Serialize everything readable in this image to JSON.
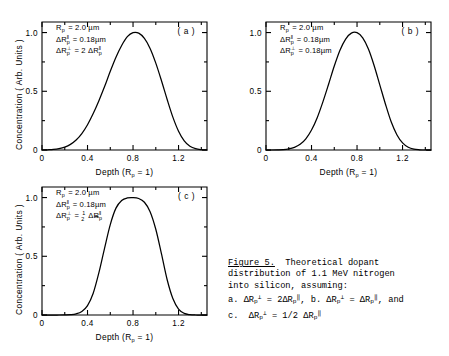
{
  "figure": {
    "axes": {
      "xlabel": "Depth (R",
      "xlabel_sub": "p",
      "xlabel_tail": " = 1)",
      "ylabel": "Concentration ( Arb. Units )",
      "xticks": [
        "0",
        "0.4",
        "0.8",
        "1.2"
      ],
      "xtickvals": [
        0,
        0.4,
        0.8,
        1.2
      ],
      "yticks": [
        "0",
        "0.5",
        "1.0"
      ],
      "ytickvals": [
        0,
        0.5,
        1.0
      ],
      "xlim": [
        0,
        1.45
      ],
      "ylim": [
        0,
        1.09
      ]
    },
    "panels": [
      {
        "tag": "( a )",
        "annotations": [
          {
            "lead": "R",
            "sub": "p",
            "sup": "",
            "rest": "= 2.0 µm"
          },
          {
            "lead": "ΔR",
            "sub": "p",
            "sup": "‖",
            "rest": "= 0.18µm"
          },
          {
            "lead": "ΔR",
            "sub": "p",
            "sup": "⊥",
            "rest": "= 2 ΔR",
            "rest_sub": "p",
            "rest_sup": "‖"
          }
        ]
      },
      {
        "tag": "( b )",
        "annotations": [
          {
            "lead": "R",
            "sub": "p",
            "sup": "",
            "rest": "= 2.0 µm"
          },
          {
            "lead": "ΔR",
            "sub": "p",
            "sup": "‖",
            "rest": "= 0.18µm"
          },
          {
            "lead": "ΔR",
            "sub": "p",
            "sup": "⊥",
            "rest": "= 0.18µm"
          }
        ]
      },
      {
        "tag": "( c )",
        "annotations": [
          {
            "lead": "R",
            "sub": "p",
            "sup": "",
            "rest": "= 2.0 µm"
          },
          {
            "lead": "ΔR",
            "sub": "p",
            "sup": "‖",
            "rest": "= 0.18µm"
          },
          {
            "lead": "ΔR",
            "sub": "p",
            "sup": "⊥",
            "rest": "= ½ ΔR",
            "rest_sub": "p",
            "rest_sup": "‖",
            "fraction": true
          }
        ]
      }
    ]
  },
  "chart_data": {
    "type": "line",
    "xlabel": "Depth (Rp = 1)",
    "ylabel": "Concentration (Arb. Units)",
    "xlim": [
      0,
      1.45
    ],
    "ylim": [
      0,
      1.09
    ],
    "xticks": [
      0,
      0.4,
      0.8,
      1.2
    ],
    "yticks": [
      0,
      0.5,
      1.0
    ],
    "grid": false,
    "legend": "none",
    "panels": [
      {
        "name": "(a)",
        "peak_x": 0.81,
        "peak_y": 1.0,
        "description": "broad asymmetric peak, widest of the three",
        "x": [
          0.0,
          0.05,
          0.1,
          0.15,
          0.2,
          0.25,
          0.3,
          0.35,
          0.4,
          0.45,
          0.5,
          0.55,
          0.6,
          0.65,
          0.7,
          0.75,
          0.8,
          0.85,
          0.9,
          0.95,
          1.0,
          1.05,
          1.1,
          1.15,
          1.2,
          1.25,
          1.3,
          1.35,
          1.4,
          1.45
        ],
        "y": [
          0.0,
          0.002,
          0.005,
          0.012,
          0.025,
          0.048,
          0.085,
          0.14,
          0.215,
          0.31,
          0.42,
          0.54,
          0.67,
          0.79,
          0.89,
          0.965,
          0.999,
          0.995,
          0.95,
          0.865,
          0.74,
          0.59,
          0.43,
          0.28,
          0.16,
          0.078,
          0.032,
          0.011,
          0.003,
          0.0
        ]
      },
      {
        "name": "(b)",
        "peak_x": 0.77,
        "peak_y": 1.0,
        "description": "intermediate width symmetric peak with rounded top",
        "x": [
          0.0,
          0.05,
          0.1,
          0.15,
          0.2,
          0.25,
          0.3,
          0.35,
          0.4,
          0.45,
          0.5,
          0.55,
          0.6,
          0.65,
          0.7,
          0.75,
          0.8,
          0.85,
          0.9,
          0.95,
          1.0,
          1.05,
          1.1,
          1.15,
          1.2,
          1.25,
          1.3,
          1.35,
          1.4,
          1.45
        ],
        "y": [
          0.0,
          0.0,
          0.001,
          0.003,
          0.009,
          0.022,
          0.048,
          0.095,
          0.17,
          0.275,
          0.41,
          0.56,
          0.715,
          0.85,
          0.945,
          0.995,
          0.999,
          0.955,
          0.86,
          0.72,
          0.555,
          0.39,
          0.24,
          0.13,
          0.06,
          0.023,
          0.007,
          0.002,
          0.0,
          0.0
        ]
      },
      {
        "name": "(c)",
        "peak_x": 0.78,
        "peak_y": 1.0,
        "description": "narrow flat-topped peak, steepest sides",
        "x": [
          0.0,
          0.05,
          0.1,
          0.15,
          0.2,
          0.25,
          0.3,
          0.35,
          0.4,
          0.45,
          0.5,
          0.55,
          0.6,
          0.65,
          0.7,
          0.75,
          0.8,
          0.85,
          0.9,
          0.95,
          1.0,
          1.05,
          1.1,
          1.15,
          1.2,
          1.25,
          1.3,
          1.35,
          1.4,
          1.45
        ],
        "y": [
          0.0,
          0.0,
          0.0,
          0.0,
          0.001,
          0.003,
          0.01,
          0.03,
          0.08,
          0.185,
          0.36,
          0.57,
          0.77,
          0.91,
          0.975,
          0.997,
          1.0,
          0.992,
          0.96,
          0.88,
          0.73,
          0.52,
          0.3,
          0.14,
          0.05,
          0.014,
          0.003,
          0.0,
          0.0,
          0.0
        ]
      }
    ]
  },
  "caption": {
    "label": "Figure 5.",
    "line1": "  Theoretical dopant",
    "line2": "distribution of 1.1 MeV nitrogen",
    "line3": "into silicon, assuming:",
    "line4_a": "a. ",
    "line4_b": ", b. ",
    "line4_c": ", and",
    "line5_a": "c.  ",
    "line5_b": " = 1/2 ",
    "eq_dr": "ΔR",
    "eq_sub": "p",
    "eq_perp": "⊥",
    "eq_par": "‖",
    "eq_eq": " = ",
    "eq_two": "2"
  }
}
